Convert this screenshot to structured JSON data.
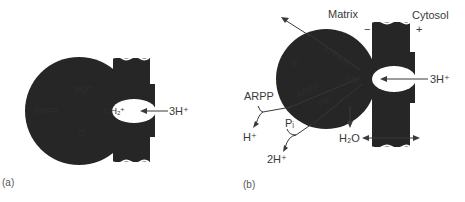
{
  "figure": {
    "panel_a": {
      "label": "(a)",
      "proton_input": "3H⁺",
      "inner_labels": {
        "left": "ARPP",
        "top": "Mg²⁺",
        "channel": "CH₂⁺",
        "bottom": "O"
      }
    },
    "panel_b": {
      "label": "(b)",
      "matrix": "Matrix",
      "cytosol": "Cytosol",
      "matrix_charge": "−",
      "cytosol_charge": "+",
      "proton_input": "3H⁺",
      "arpp": "ARPP",
      "h_plus": "H⁺",
      "pi": "Pᵢ",
      "two_h_plus": "2H⁺",
      "water": "H₂O",
      "inner_labels": {
        "upper_band": "ATPase",
        "left": "S",
        "middle_band": "ARPP",
        "lower_band": "PPi",
        "center": "Mg"
      }
    },
    "colors": {
      "background": "#ffffff",
      "protein": "#262626",
      "line": "#3a3a3a"
    }
  }
}
